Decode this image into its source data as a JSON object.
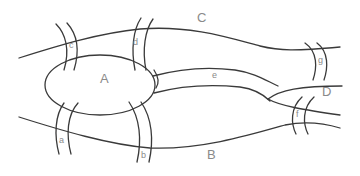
{
  "diagram": {
    "stroke_color": "#3a3a3a",
    "label_color": "#8a8a8a",
    "regions": [
      {
        "id": "A",
        "label": "A",
        "x": 100,
        "y": 70
      },
      {
        "id": "B",
        "label": "B",
        "x": 207,
        "y": 150
      },
      {
        "id": "C",
        "label": "C",
        "x": 197,
        "y": 10
      },
      {
        "id": "D",
        "label": "D",
        "x": 326,
        "y": 84
      }
    ],
    "bridges": [
      {
        "id": "a",
        "label": "a",
        "x": 58,
        "y": 137
      },
      {
        "id": "b",
        "label": "b",
        "x": 141,
        "y": 152
      },
      {
        "id": "c",
        "label": "c",
        "x": 70,
        "y": 42
      },
      {
        "id": "d",
        "label": "d",
        "x": 132,
        "y": 40
      },
      {
        "id": "e",
        "label": "e",
        "x": 212,
        "y": 69
      },
      {
        "id": "f",
        "label": "f",
        "x": 295,
        "y": 109
      },
      {
        "id": "g",
        "label": "g",
        "x": 319,
        "y": 56
      }
    ]
  }
}
